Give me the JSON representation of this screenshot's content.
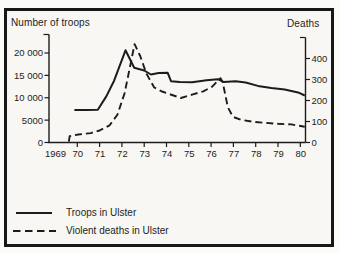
{
  "figure": {
    "ink_color": "#1c1c1c",
    "paper_color": "#f8f7f3"
  },
  "chart_data": {
    "type": "line",
    "title": "",
    "x_axis": {
      "tick_labels": [
        "1969",
        "70",
        "71",
        "72",
        "73",
        "74",
        "75",
        "76",
        "77",
        "78",
        "79",
        "80"
      ],
      "tick_years": [
        1969,
        1970,
        1971,
        1972,
        1973,
        1974,
        1975,
        1976,
        1977,
        1978,
        1979,
        1980
      ],
      "range": [
        1969,
        1980.25
      ]
    },
    "left_axis": {
      "title": "Number of troops",
      "tick_labels": [
        "20 000",
        "15 000",
        "10 000",
        "5000",
        "0"
      ],
      "tick_values": [
        20000,
        15000,
        10000,
        5000,
        0
      ],
      "range": [
        0,
        22500
      ]
    },
    "right_axis": {
      "title": "Deaths",
      "tick_labels": [
        "400",
        "300",
        "200",
        "100",
        "0"
      ],
      "tick_values": [
        400,
        300,
        200,
        100,
        0
      ],
      "range": [
        0,
        480
      ]
    },
    "grid": false,
    "legend_position": "bottom-left",
    "series": [
      {
        "name": "Troops in Ulster",
        "axis": "left",
        "style": "solid",
        "points": [
          [
            1969.87,
            7250
          ],
          [
            1970.35,
            7250
          ],
          [
            1970.92,
            7300
          ],
          [
            1971.3,
            10300
          ],
          [
            1971.65,
            13800
          ],
          [
            1972.16,
            20600
          ],
          [
            1972.55,
            16700
          ],
          [
            1973.0,
            16100
          ],
          [
            1973.3,
            15200
          ],
          [
            1973.65,
            15500
          ],
          [
            1974.05,
            15600
          ],
          [
            1974.2,
            13700
          ],
          [
            1974.6,
            13500
          ],
          [
            1975.15,
            13450
          ],
          [
            1975.8,
            13900
          ],
          [
            1976.3,
            14150
          ],
          [
            1976.55,
            13550
          ],
          [
            1977.1,
            13700
          ],
          [
            1977.55,
            13400
          ],
          [
            1978.1,
            12650
          ],
          [
            1978.7,
            12200
          ],
          [
            1979.3,
            11850
          ],
          [
            1979.9,
            11200
          ],
          [
            1980.2,
            10500
          ]
        ]
      },
      {
        "name": "Violent deaths in Ulster",
        "axis": "right",
        "style": "dashed",
        "points": [
          [
            1969.62,
            4
          ],
          [
            1969.66,
            30
          ],
          [
            1970.05,
            38
          ],
          [
            1970.6,
            45
          ],
          [
            1971.0,
            57
          ],
          [
            1971.45,
            82
          ],
          [
            1971.8,
            132
          ],
          [
            1972.12,
            235
          ],
          [
            1972.57,
            468
          ],
          [
            1972.82,
            412
          ],
          [
            1973.1,
            328
          ],
          [
            1973.45,
            262
          ],
          [
            1973.8,
            243
          ],
          [
            1974.15,
            230
          ],
          [
            1974.65,
            212
          ],
          [
            1975.15,
            228
          ],
          [
            1975.65,
            244
          ],
          [
            1976.05,
            266
          ],
          [
            1976.32,
            296
          ],
          [
            1976.42,
            306
          ],
          [
            1976.52,
            288
          ],
          [
            1976.75,
            168
          ],
          [
            1976.98,
            122
          ],
          [
            1977.35,
            108
          ],
          [
            1977.85,
            99
          ],
          [
            1978.4,
            94
          ],
          [
            1979.0,
            89
          ],
          [
            1979.6,
            86
          ],
          [
            1980.2,
            75
          ]
        ]
      }
    ]
  }
}
